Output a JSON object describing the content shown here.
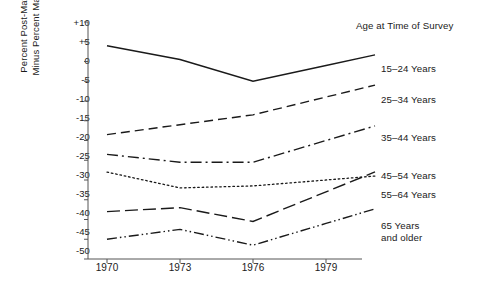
{
  "chart_data": {
    "type": "line",
    "title": "",
    "xlabel": "",
    "ylabel_line1": "Percent Post-Materialist",
    "ylabel_line2": "Minus Percent Materialist",
    "x": [
      1970,
      1973,
      1976,
      1979
    ],
    "xtick_labels": [
      "1970",
      "1973",
      "1976",
      "1979"
    ],
    "ytick_labels": [
      "+10",
      "+5",
      "0",
      "-5",
      "-10",
      "-15",
      "-20",
      "-25",
      "-30",
      "-35",
      "-40",
      "-45",
      "-50"
    ],
    "ytick_values": [
      10,
      5,
      0,
      -5,
      -10,
      -15,
      -20,
      -25,
      -30,
      -35,
      -40,
      -45,
      -50
    ],
    "ylim": [
      -50,
      10
    ],
    "xlim": [
      1970,
      1979
    ],
    "grid": false,
    "legend_position": "right",
    "legend_title": "Age at Time of Survey",
    "series": [
      {
        "name": "15-24 Years",
        "label_line1": "15–24 Years",
        "label_line2": "",
        "style": "solid",
        "dash": "none",
        "values": [
          4,
          0.5,
          -5,
          -1
        ]
      },
      {
        "name": "25-34 Years",
        "label_line1": "25–34 Years",
        "label_line2": "",
        "style": "dashed",
        "dash": "9,5",
        "values": [
          -18.5,
          -16,
          -13.5,
          -9
        ]
      },
      {
        "name": "35-44 Years",
        "label_line1": "35–44 Years",
        "label_line2": "",
        "style": "dash-dot",
        "dash": "11,4,2,4",
        "values": [
          -23.5,
          -25.5,
          -25.5,
          -20
        ]
      },
      {
        "name": "45-54 Years",
        "label_line1": "45–54 Years",
        "label_line2": "",
        "style": "dotted",
        "dash": "1.6,2.8",
        "values": [
          -28,
          -32,
          -31.5,
          -30
        ]
      },
      {
        "name": "55-64 Years",
        "label_line1": "55–64 Years",
        "label_line2": "",
        "style": "long-dash",
        "dash": "13,5",
        "values": [
          -38,
          -37,
          -40.5,
          -33
        ]
      },
      {
        "name": "65 Years and older",
        "label_line1": "65  Years",
        "label_line2": "and older",
        "style": "dash-dot-dot",
        "dash": "10,3,1.5,3,1.5,3",
        "values": [
          -45,
          -42.5,
          -46.5,
          -41
        ]
      }
    ],
    "axis_color": "#555555",
    "line_color": "#1a1a1a",
    "background": "#ffffff"
  }
}
